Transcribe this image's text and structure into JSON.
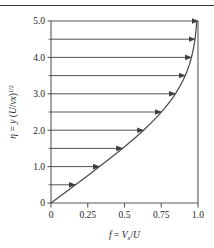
{
  "figure": {
    "top_rule": true,
    "background_color": "#ffffff",
    "line_color": "#4a4a4a",
    "axis_color": "#5a5a5a",
    "text_color": "#1c1c1c"
  },
  "chart_data": {
    "type": "line",
    "title": "",
    "subtitle": "",
    "xlabel": "f = V_x/U",
    "ylabel": "eta = y (U/vx)^(1/2)",
    "xlabel_parts": {
      "f": "f",
      "eq": "=",
      "V": "V",
      "x": "x",
      "slash": "/",
      "U": "U"
    },
    "ylabel_parts": {
      "eta": "η",
      "eq": "=",
      "y": "y",
      "open": "(",
      "U": "U",
      "slash": "/",
      "nu": "ν",
      "x": "x",
      "close": ")",
      "exp": "1/2"
    },
    "xlim": [
      0,
      1.0
    ],
    "ylim": [
      0,
      5.0
    ],
    "grid": false,
    "x_ticks": [
      0,
      0.25,
      0.5,
      0.75,
      1.0
    ],
    "x_tick_labels": [
      "0",
      "0.25",
      "0.5",
      "0.75",
      "1.0"
    ],
    "y_ticks": [
      0,
      1.0,
      2.0,
      3.0,
      4.0,
      5.0
    ],
    "y_tick_labels": [
      "0",
      "1.0",
      "2.0",
      "3.0",
      "4.0",
      "5.0"
    ],
    "y_minor_ticks": [
      0.5,
      1.5,
      2.5,
      3.5,
      4.5
    ],
    "series": [
      {
        "name": "Blasius velocity profile",
        "x": [
          0.0,
          0.0664,
          0.1328,
          0.1989,
          0.2647,
          0.3298,
          0.3938,
          0.4563,
          0.5168,
          0.5748,
          0.6298,
          0.6813,
          0.729,
          0.7725,
          0.8115,
          0.8461,
          0.8761,
          0.9018,
          0.9233,
          0.9411,
          0.9555,
          0.967,
          0.9759,
          0.9827,
          0.9878,
          0.9915,
          0.9942,
          0.9962,
          0.9975,
          0.9984,
          0.999,
          0.9994,
          0.9996,
          0.9998,
          0.9999,
          1.0
        ],
        "y": [
          0.0,
          0.2,
          0.4,
          0.6,
          0.8,
          1.0,
          1.2,
          1.4,
          1.6,
          1.8,
          2.0,
          2.2,
          2.4,
          2.6,
          2.8,
          3.0,
          3.2,
          3.4,
          3.6,
          3.8,
          4.0,
          4.2,
          4.4,
          4.6,
          4.8,
          5.0,
          5.2,
          5.4,
          5.6,
          5.8,
          6.0,
          6.2,
          6.4,
          6.6,
          6.8,
          7.0
        ]
      }
    ],
    "annotations": {
      "type": "horizontal-arrows",
      "description": "Horizontal velocity vectors from the wall axis to the profile curve",
      "arrows": [
        {
          "eta": 0.5,
          "f": 0.1659
        },
        {
          "eta": 1.0,
          "f": 0.3298
        },
        {
          "eta": 1.5,
          "f": 0.4868
        },
        {
          "eta": 2.0,
          "f": 0.6298
        },
        {
          "eta": 2.5,
          "f": 0.7513
        },
        {
          "eta": 3.0,
          "f": 0.8461
        },
        {
          "eta": 3.5,
          "f": 0.9131
        },
        {
          "eta": 4.0,
          "f": 0.9555
        },
        {
          "eta": 4.5,
          "f": 0.9795
        },
        {
          "eta": 5.0,
          "f": 1.0
        }
      ]
    }
  }
}
